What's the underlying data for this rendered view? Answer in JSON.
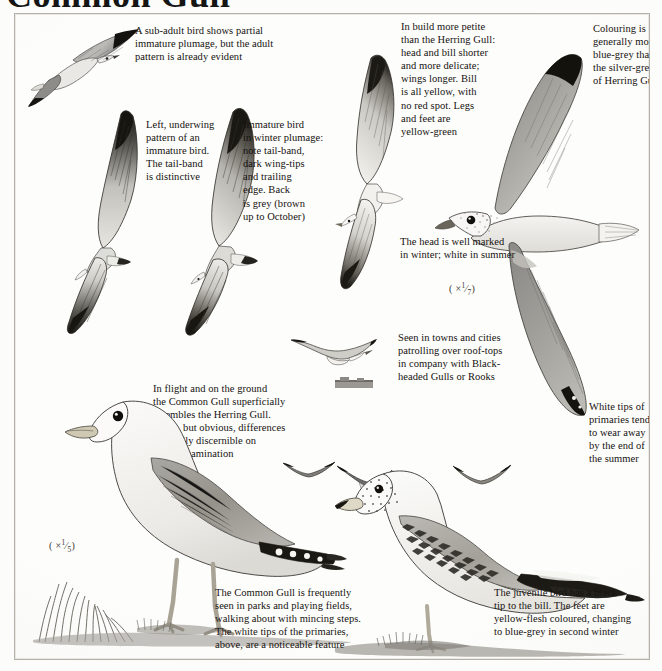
{
  "page": {
    "title": "Common Gull",
    "scientific_name": "Larus canus",
    "background_hex": "#fdfdfb",
    "ink_hex": "#151210",
    "border_hex": "#b3b0a9"
  },
  "captions": [
    {
      "id": "sub-adult",
      "text": "A sub-adult bird shows partial\nimmature plumage, but the adult\npattern is already evident"
    },
    {
      "id": "underwing",
      "text": "Left, underwing\npattern of an\nimmature bird.\nThe tail-band\nis distinctive"
    },
    {
      "id": "immature-winter",
      "text": "Immature bird\nin winter plumage:\nnote tail-band,\ndark wing-tips\nand trailing\nedge. Back\nis grey (brown\nup to October)"
    },
    {
      "id": "build",
      "text": "In build more petite\nthan the Herring Gull:\nhead and bill shorter\nand more delicate;\nwings longer. Bill\nis all yellow, with\nno red spot. Legs\nand feet are\nyellow-green"
    },
    {
      "id": "colouring",
      "text": "Colouring is\ngenerally more\nblue-grey than\nthe silver-grey\nof Herring Gull"
    },
    {
      "id": "head-marking",
      "text": "The head is well marked\nin winter; white in summer"
    },
    {
      "id": "towns",
      "text": "Seen in towns and cities\npatrolling over roof-tops\nin company with Black-\nheaded Gulls or Rooks"
    },
    {
      "id": "in-flight",
      "text": "In flight and on the ground\nthe Common Gull superficially\nresembles the Herring Gull.\nSmall, but obvious, differences\nare easily discernible on\ncloser examination"
    },
    {
      "id": "white-tips",
      "text": "White tips of\nprimaries tend\nto wear away\nby the end of\nthe summer"
    },
    {
      "id": "parks",
      "text": "The Common Gull is frequently\nseen in parks and playing fields,\nwalking about with mincing steps.\nThe white tips of the primaries,\nabove, are a noticeable feature"
    },
    {
      "id": "juvenile",
      "text": "The juvenile bird has a black\ntip to the bill. The feet are\nyellow-flesh coloured, changing\nto blue-grey in second winter"
    }
  ],
  "scales": [
    {
      "id": "scale-flying",
      "prefix": "( ×",
      "numerator": "1",
      "denominator": "7",
      "suffix": ")"
    },
    {
      "id": "scale-standing",
      "prefix": "( ×",
      "numerator": "1",
      "denominator": "5",
      "suffix": ")"
    }
  ],
  "figures": [
    {
      "id": "sub-adult-gull-flying",
      "label": "sub-adult gull in flight, upperside"
    },
    {
      "id": "immature-gull-underwing",
      "label": "immature gull underwing pattern"
    },
    {
      "id": "immature-gull-winter-flying",
      "label": "immature gull in winter plumage, flying"
    },
    {
      "id": "adult-gull-flying-large",
      "label": "adult Common Gull in flight, large scale"
    },
    {
      "id": "small-gull-soaring",
      "label": "small soaring gull over rooftops"
    },
    {
      "id": "rooftop-silhouette",
      "label": "rooftop silhouette"
    },
    {
      "id": "adult-gull-standing",
      "label": "adult Common Gull standing in grass"
    },
    {
      "id": "juvenile-gull-standing",
      "label": "juvenile Common Gull standing"
    },
    {
      "id": "distant-gull-a",
      "label": "distant flying gull"
    },
    {
      "id": "distant-gull-b",
      "label": "distant flying gull"
    },
    {
      "id": "distant-gull-c",
      "label": "distant flying gull"
    }
  ]
}
